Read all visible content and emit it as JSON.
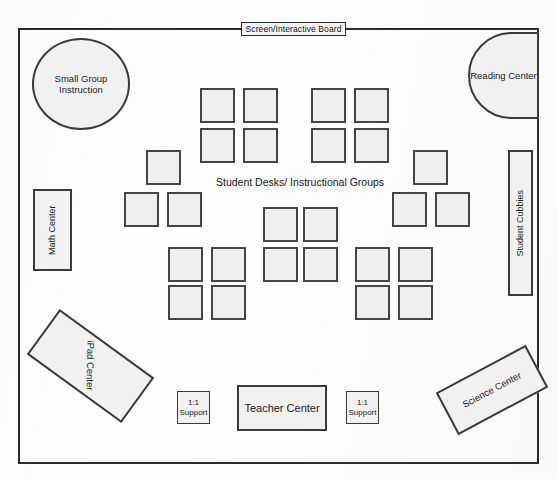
{
  "diagram": {
    "room": {
      "x": 18,
      "y": 28,
      "width": 521,
      "height": 436
    },
    "screen_label": "Screen/Interactive Board",
    "center_caption": "Student Desks/ Instructional Groups",
    "colors": {
      "wall": "#2b2b2b",
      "furniture_fill": "#f1f1f1",
      "furniture_stroke": "#3a3a3a",
      "desk_fill": "#efefef",
      "desk_stroke": "#454545",
      "text": "#1b1b1b",
      "page": "#ffffff"
    },
    "zones": [
      {
        "name": "small-group-instruction",
        "label": "Small Group Instruction",
        "shape": "circle"
      },
      {
        "name": "reading-center",
        "label": "Reading Center",
        "shape": "half-circle"
      },
      {
        "name": "math-center",
        "label": "Math Center",
        "shape": "vertical-rectangle"
      },
      {
        "name": "student-cubbies",
        "label": "Student Cubbies",
        "shape": "vertical-rectangle"
      },
      {
        "name": "ipad-center",
        "label": "iPad Center",
        "shape": "rotated-rectangle"
      },
      {
        "name": "science-center",
        "label": "Science Center",
        "shape": "rotated-rectangle"
      },
      {
        "name": "teacher-center",
        "label": "Teacher Center",
        "shape": "rectangle"
      },
      {
        "name": "support-left",
        "label": "1:1 Support",
        "shape": "rectangle"
      },
      {
        "name": "support-right",
        "label": "1:1 Support",
        "shape": "rectangle"
      }
    ],
    "desk_count": 28,
    "desks": [
      {
        "x": 200,
        "y": 88
      },
      {
        "x": 243,
        "y": 88
      },
      {
        "x": 200,
        "y": 128
      },
      {
        "x": 243,
        "y": 128
      },
      {
        "x": 311,
        "y": 88
      },
      {
        "x": 354,
        "y": 88
      },
      {
        "x": 311,
        "y": 128
      },
      {
        "x": 354,
        "y": 128
      },
      {
        "x": 146,
        "y": 150
      },
      {
        "x": 124,
        "y": 192
      },
      {
        "x": 167,
        "y": 192
      },
      {
        "x": 413,
        "y": 150
      },
      {
        "x": 392,
        "y": 192
      },
      {
        "x": 435,
        "y": 192
      },
      {
        "x": 263,
        "y": 207
      },
      {
        "x": 303,
        "y": 207
      },
      {
        "x": 263,
        "y": 247
      },
      {
        "x": 303,
        "y": 247
      },
      {
        "x": 168,
        "y": 247
      },
      {
        "x": 211,
        "y": 247
      },
      {
        "x": 168,
        "y": 285
      },
      {
        "x": 211,
        "y": 285
      },
      {
        "x": 355,
        "y": 247
      },
      {
        "x": 398,
        "y": 247
      },
      {
        "x": 355,
        "y": 285
      },
      {
        "x": 398,
        "y": 285
      }
    ]
  }
}
